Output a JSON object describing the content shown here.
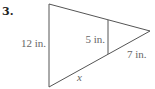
{
  "problem": {
    "number": "3.",
    "labels": {
      "left_side": "12 in.",
      "inner_segment": "5 in.",
      "right_segment": "7 in.",
      "bottom_variable": "x"
    }
  },
  "colors": {
    "stroke": "#555555",
    "label": "#666666"
  }
}
